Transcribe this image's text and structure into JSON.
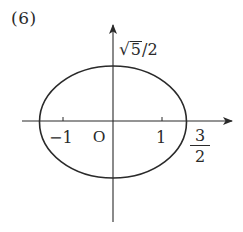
{
  "figure": {
    "label": "(6)"
  },
  "diagram": {
    "type": "ellipse-on-axes",
    "stroke_color": "#2a2a2a",
    "axes": {
      "x_axis": {
        "has_arrow": true,
        "direction": "right"
      },
      "y_axis": {
        "has_arrow": true,
        "direction": "up"
      },
      "origin_label": "O"
    },
    "ellipse": {
      "semi_major_x": "3/2",
      "semi_minor_y": "√5/2"
    },
    "ticks": [
      {
        "value": -1,
        "label": "−1"
      },
      {
        "value": 1,
        "label": "1"
      }
    ],
    "labels": {
      "y_intercept": {
        "sqrt_sign": "√",
        "radicand": "5",
        "rest": "/2"
      },
      "x_intercept": {
        "numerator": "3",
        "denominator": "2"
      },
      "neg_one": "−1",
      "origin": "O",
      "pos_one": "1"
    }
  }
}
